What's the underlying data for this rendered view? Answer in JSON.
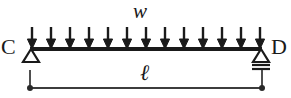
{
  "figure": {
    "kind": "engineering-beam-free-body-diagram",
    "background_color": "#ffffff",
    "ink_color": "#1a1a1a",
    "width_px": 291,
    "height_px": 98
  },
  "labels": {
    "load": "w",
    "span": "ℓ",
    "left_support": "C",
    "right_support": "D"
  },
  "beam": {
    "x_start": 30,
    "x_end": 262,
    "y": 49,
    "thickness": 4,
    "color": "#1a1a1a"
  },
  "distributed_load": {
    "symbol": "w",
    "direction": "down",
    "arrow_count": 13,
    "arrow_top_y": 27,
    "arrow_tip_y": 48,
    "first_arrow_x": 32,
    "last_arrow_x": 260,
    "color": "#1a1a1a"
  },
  "supports": [
    {
      "name": "left-support",
      "label": "C",
      "type": "pin",
      "x": 31,
      "y": 49,
      "half_width": 8,
      "height": 13,
      "ground_lines": 0
    },
    {
      "name": "right-support",
      "label": "D",
      "type": "roller",
      "x": 261,
      "y": 49,
      "half_width": 8,
      "height": 13,
      "ground_lines": 2
    }
  ],
  "dimension": {
    "symbol": "ℓ",
    "y": 88,
    "x_start": 30,
    "x_end": 262,
    "tick_top_y": 70,
    "endpoint_marker": "dot",
    "endpoint_radius": 3,
    "color": "#3c3c3c"
  }
}
